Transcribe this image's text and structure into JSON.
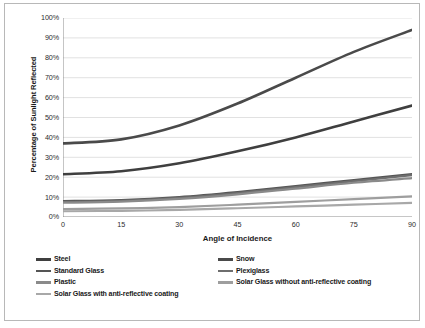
{
  "chart_data": {
    "type": "line",
    "title": "",
    "xlabel": "Angle of Incidence",
    "ylabel": "Percentage of Sunlight Reflected",
    "x": [
      0,
      15,
      30,
      45,
      60,
      75,
      90
    ],
    "xlim": [
      0,
      90
    ],
    "ylim": [
      0,
      100
    ],
    "xtick_labels": [
      "0",
      "15",
      "30",
      "45",
      "60",
      "75",
      "90"
    ],
    "ytick_labels": [
      "0%",
      "10%",
      "20%",
      "30%",
      "40%",
      "50%",
      "60%",
      "70%",
      "80%",
      "90%",
      "100%"
    ],
    "ytick_values": [
      0,
      10,
      20,
      30,
      40,
      50,
      60,
      70,
      80,
      90,
      100
    ],
    "grid": "horizontal",
    "legend_position": "bottom",
    "series": [
      {
        "name": "Snow",
        "color": "#4a4a4a",
        "width": 2.6,
        "values": [
          37,
          39,
          46,
          57,
          70,
          83,
          94
        ]
      },
      {
        "name": "Steel",
        "color": "#3f3f3f",
        "width": 2.6,
        "values": [
          21.5,
          23,
          27,
          33,
          40,
          48,
          56
        ]
      },
      {
        "name": "Standard Glass",
        "color": "#555555",
        "width": 2.4,
        "values": [
          8,
          8.5,
          10,
          12.5,
          15.5,
          18.5,
          21.5
        ]
      },
      {
        "name": "Plexiglass",
        "color": "#6e6e6e",
        "width": 2.2,
        "values": [
          7.6,
          8.1,
          9.6,
          12,
          15,
          18,
          21
        ]
      },
      {
        "name": "Plastic",
        "color": "#8a8a8a",
        "width": 2.2,
        "values": [
          7.2,
          7.7,
          9.1,
          11.4,
          14.3,
          17.2,
          19.5
        ]
      },
      {
        "name": "Solar Glass without anti-reflective coating",
        "color": "#9e9e9e",
        "width": 2.2,
        "values": [
          4,
          4.3,
          5,
          6.2,
          7.6,
          9,
          10.4
        ]
      },
      {
        "name": "Solar Glass with anti-reflective coating",
        "color": "#a8a8a8",
        "width": 2.2,
        "values": [
          2.9,
          3.1,
          3.6,
          4.4,
          5.3,
          6.2,
          7.1
        ]
      }
    ]
  },
  "legend": {
    "entries": [
      {
        "label": "Steel",
        "color": "#3f3f3f"
      },
      {
        "label": "Snow",
        "color": "#4a4a4a"
      },
      {
        "label": "Standard Glass",
        "color": "#555555"
      },
      {
        "label": "Plexiglass",
        "color": "#6e6e6e"
      },
      {
        "label": "Plastic",
        "color": "#8a8a8a"
      },
      {
        "label": "Solar Glass without anti-reflective coating",
        "color": "#9e9e9e"
      },
      {
        "label": "Solar Glass with anti-reflective coating",
        "color": "#a8a8a8"
      }
    ]
  },
  "style": {
    "plot_border": "#808080",
    "gridline": "#d4d4d4",
    "frame": "#b8b8b8",
    "text": "#1a1a1a"
  }
}
